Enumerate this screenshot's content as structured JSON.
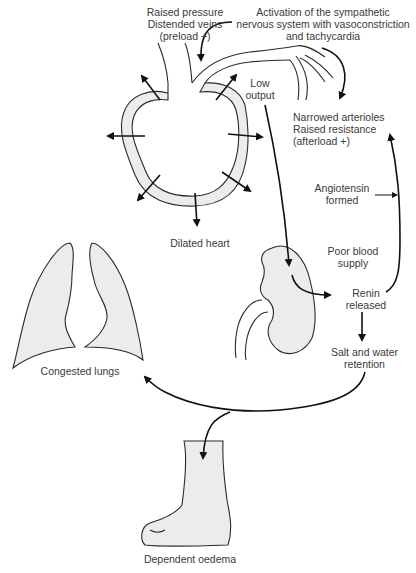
{
  "colors": {
    "outline": "#2b2b2b",
    "organ_fill": "#ececec",
    "text": "#3a3a3a",
    "background": "#ffffff"
  },
  "labels": {
    "preload": [
      "Raised pressure",
      "Distended veins",
      "(preload +)"
    ],
    "sympathetic": [
      "Activation of the sympathetic",
      "nervous system with vasoconstriction",
      "and tachycardia"
    ],
    "low_output": [
      "Low",
      "output"
    ],
    "afterload": [
      "Narrowed arterioles",
      "Raised resistance",
      "(afterload +)"
    ],
    "angiotensin": [
      "Angiotensin",
      "formed"
    ],
    "dilated_heart": "Dilated heart",
    "poor_blood_supply": [
      "Poor blood",
      "supply"
    ],
    "renin": [
      "Renin",
      "released"
    ],
    "salt_water": [
      "Salt and water",
      "retention"
    ],
    "congested_lungs": "Congested lungs",
    "dependent_oedema": "Dependent oedema"
  },
  "flow": [
    {
      "from": "sympathetic",
      "to": "veins"
    },
    {
      "from": "sympathetic",
      "to": "afterload"
    },
    {
      "from": "heart",
      "to": "kidney",
      "via": "low_output"
    },
    {
      "from": "kidney",
      "to": "renin",
      "via": "poor_blood_supply"
    },
    {
      "from": "renin",
      "to": "afterload",
      "via": "angiotensin"
    },
    {
      "from": "renin",
      "to": "salt_water"
    },
    {
      "from": "salt_water",
      "to": "congested_lungs"
    },
    {
      "from": "salt_water",
      "to": "dependent_oedema"
    }
  ]
}
